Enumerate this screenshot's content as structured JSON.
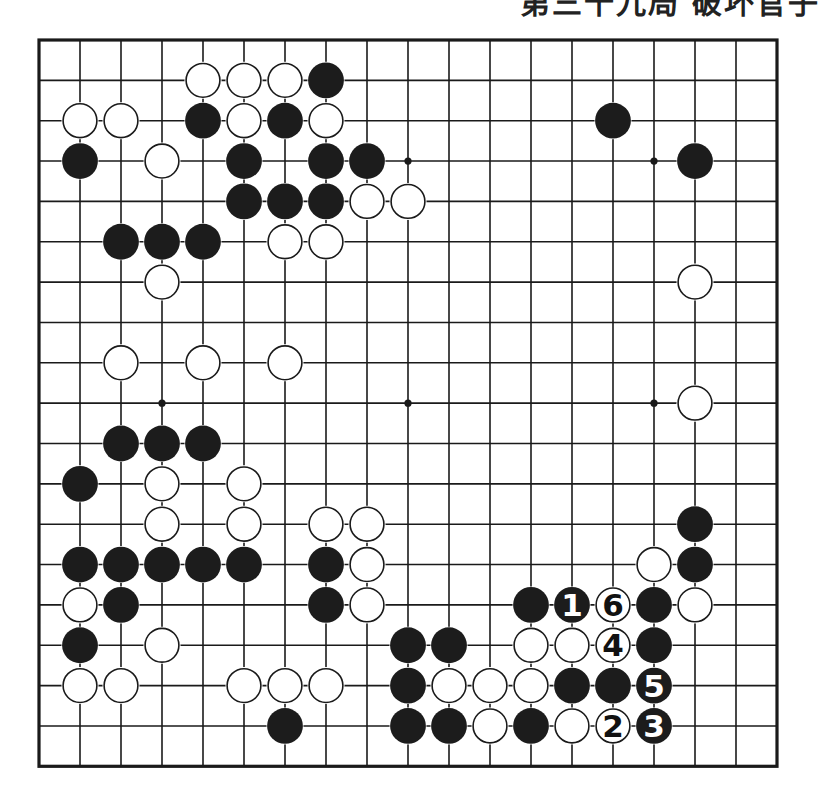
{
  "header": {
    "title": "第三十九局 破坏官子"
  },
  "board": {
    "size": 19,
    "origin": {
      "x": 39,
      "y": 40
    },
    "spacing": {
      "x": 41.0,
      "y": 40.35
    },
    "stone_diameter": 37,
    "colors": {
      "line": "#1a1a1a",
      "black": "#1c1c1c",
      "white": "#ffffff",
      "paper": "#ffffff"
    },
    "star_points": [
      [
        3,
        3
      ],
      [
        9,
        3
      ],
      [
        15,
        3
      ],
      [
        3,
        9
      ],
      [
        9,
        9
      ],
      [
        15,
        9
      ],
      [
        3,
        15
      ],
      [
        9,
        15
      ],
      [
        15,
        15
      ]
    ],
    "stones": [
      {
        "c": 4,
        "r": 1,
        "color": "W"
      },
      {
        "c": 5,
        "r": 1,
        "color": "W"
      },
      {
        "c": 6,
        "r": 1,
        "color": "W"
      },
      {
        "c": 7,
        "r": 1,
        "color": "B"
      },
      {
        "c": 1,
        "r": 2,
        "color": "W"
      },
      {
        "c": 2,
        "r": 2,
        "color": "W"
      },
      {
        "c": 4,
        "r": 2,
        "color": "B"
      },
      {
        "c": 5,
        "r": 2,
        "color": "W"
      },
      {
        "c": 6,
        "r": 2,
        "color": "B"
      },
      {
        "c": 7,
        "r": 2,
        "color": "W"
      },
      {
        "c": 14,
        "r": 2,
        "color": "B"
      },
      {
        "c": 1,
        "r": 3,
        "color": "B"
      },
      {
        "c": 3,
        "r": 3,
        "color": "W"
      },
      {
        "c": 5,
        "r": 3,
        "color": "B"
      },
      {
        "c": 7,
        "r": 3,
        "color": "B"
      },
      {
        "c": 8,
        "r": 3,
        "color": "B"
      },
      {
        "c": 16,
        "r": 3,
        "color": "B"
      },
      {
        "c": 5,
        "r": 4,
        "color": "B"
      },
      {
        "c": 6,
        "r": 4,
        "color": "B"
      },
      {
        "c": 7,
        "r": 4,
        "color": "B"
      },
      {
        "c": 8,
        "r": 4,
        "color": "W"
      },
      {
        "c": 9,
        "r": 4,
        "color": "W"
      },
      {
        "c": 2,
        "r": 5,
        "color": "B"
      },
      {
        "c": 3,
        "r": 5,
        "color": "B"
      },
      {
        "c": 4,
        "r": 5,
        "color": "B"
      },
      {
        "c": 6,
        "r": 5,
        "color": "W"
      },
      {
        "c": 7,
        "r": 5,
        "color": "W"
      },
      {
        "c": 3,
        "r": 6,
        "color": "W"
      },
      {
        "c": 16,
        "r": 6,
        "color": "W"
      },
      {
        "c": 2,
        "r": 8,
        "color": "W"
      },
      {
        "c": 4,
        "r": 8,
        "color": "W"
      },
      {
        "c": 6,
        "r": 8,
        "color": "W"
      },
      {
        "c": 16,
        "r": 9,
        "color": "W"
      },
      {
        "c": 2,
        "r": 10,
        "color": "B"
      },
      {
        "c": 3,
        "r": 10,
        "color": "B"
      },
      {
        "c": 4,
        "r": 10,
        "color": "B"
      },
      {
        "c": 1,
        "r": 11,
        "color": "B"
      },
      {
        "c": 3,
        "r": 11,
        "color": "W"
      },
      {
        "c": 5,
        "r": 11,
        "color": "W"
      },
      {
        "c": 3,
        "r": 12,
        "color": "W"
      },
      {
        "c": 5,
        "r": 12,
        "color": "W"
      },
      {
        "c": 7,
        "r": 12,
        "color": "W"
      },
      {
        "c": 8,
        "r": 12,
        "color": "W"
      },
      {
        "c": 16,
        "r": 12,
        "color": "B"
      },
      {
        "c": 1,
        "r": 13,
        "color": "B"
      },
      {
        "c": 2,
        "r": 13,
        "color": "B"
      },
      {
        "c": 3,
        "r": 13,
        "color": "B"
      },
      {
        "c": 4,
        "r": 13,
        "color": "B"
      },
      {
        "c": 5,
        "r": 13,
        "color": "B"
      },
      {
        "c": 7,
        "r": 13,
        "color": "B"
      },
      {
        "c": 8,
        "r": 13,
        "color": "W"
      },
      {
        "c": 15,
        "r": 13,
        "color": "W"
      },
      {
        "c": 16,
        "r": 13,
        "color": "B"
      },
      {
        "c": 1,
        "r": 14,
        "color": "W"
      },
      {
        "c": 2,
        "r": 14,
        "color": "B"
      },
      {
        "c": 7,
        "r": 14,
        "color": "B"
      },
      {
        "c": 8,
        "r": 14,
        "color": "W"
      },
      {
        "c": 12,
        "r": 14,
        "color": "B"
      },
      {
        "c": 13,
        "r": 14,
        "color": "B",
        "label": "1"
      },
      {
        "c": 14,
        "r": 14,
        "color": "W",
        "label": "6"
      },
      {
        "c": 15,
        "r": 14,
        "color": "B"
      },
      {
        "c": 16,
        "r": 14,
        "color": "W"
      },
      {
        "c": 1,
        "r": 15,
        "color": "B"
      },
      {
        "c": 3,
        "r": 15,
        "color": "W"
      },
      {
        "c": 9,
        "r": 15,
        "color": "B"
      },
      {
        "c": 10,
        "r": 15,
        "color": "B"
      },
      {
        "c": 12,
        "r": 15,
        "color": "W"
      },
      {
        "c": 13,
        "r": 15,
        "color": "W"
      },
      {
        "c": 14,
        "r": 15,
        "color": "W",
        "label": "4"
      },
      {
        "c": 15,
        "r": 15,
        "color": "B"
      },
      {
        "c": 1,
        "r": 16,
        "color": "W"
      },
      {
        "c": 2,
        "r": 16,
        "color": "W"
      },
      {
        "c": 5,
        "r": 16,
        "color": "W"
      },
      {
        "c": 6,
        "r": 16,
        "color": "W"
      },
      {
        "c": 7,
        "r": 16,
        "color": "W"
      },
      {
        "c": 9,
        "r": 16,
        "color": "B"
      },
      {
        "c": 10,
        "r": 16,
        "color": "W"
      },
      {
        "c": 11,
        "r": 16,
        "color": "W"
      },
      {
        "c": 12,
        "r": 16,
        "color": "W"
      },
      {
        "c": 13,
        "r": 16,
        "color": "B"
      },
      {
        "c": 14,
        "r": 16,
        "color": "B"
      },
      {
        "c": 15,
        "r": 16,
        "color": "B",
        "label": "5"
      },
      {
        "c": 6,
        "r": 17,
        "color": "B"
      },
      {
        "c": 9,
        "r": 17,
        "color": "B"
      },
      {
        "c": 10,
        "r": 17,
        "color": "B"
      },
      {
        "c": 11,
        "r": 17,
        "color": "W"
      },
      {
        "c": 12,
        "r": 17,
        "color": "B"
      },
      {
        "c": 13,
        "r": 17,
        "color": "W"
      },
      {
        "c": 14,
        "r": 17,
        "color": "W",
        "label": "2"
      },
      {
        "c": 15,
        "r": 17,
        "color": "B",
        "label": "3"
      }
    ]
  }
}
